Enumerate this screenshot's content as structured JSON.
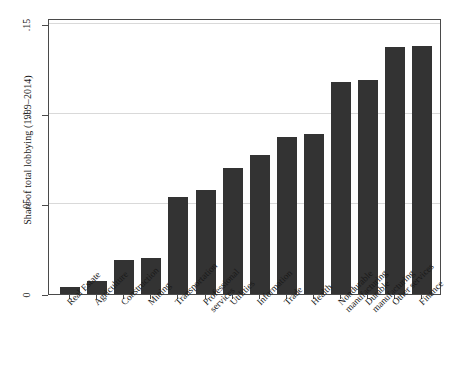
{
  "chart_data": {
    "type": "bar",
    "title": "",
    "xlabel": "",
    "ylabel": "Share of total lobbying (1999–2014)",
    "ylim": [
      0,
      0.15
    ],
    "yticks": [
      0,
      0.05,
      0.1,
      0.15
    ],
    "ytick_labels": [
      "0",
      ".05",
      ".1",
      ".15"
    ],
    "grid": true,
    "legend": "none",
    "bar_color": "#333333",
    "categories": [
      "Real Estate",
      "Agriculture",
      "Construction",
      "Mining",
      "Transportation",
      "Professional services",
      "Utilities",
      "Information",
      "Trade",
      "Health",
      "Nondurable manufacturing",
      "Durable manufacturing",
      "Other services",
      "Finance"
    ],
    "category_lines": [
      [
        "Real Estate"
      ],
      [
        "Agriculture"
      ],
      [
        "Construction"
      ],
      [
        "Mining"
      ],
      [
        "Transportation"
      ],
      [
        "Professional",
        "services"
      ],
      [
        "Utilities"
      ],
      [
        "Information"
      ],
      [
        "Trade"
      ],
      [
        "Health"
      ],
      [
        "Nondurable",
        "manufacturing"
      ],
      [
        "Durable",
        "manufacturing"
      ],
      [
        "Other services"
      ],
      [
        "Finance"
      ]
    ],
    "values": [
      0.004,
      0.007,
      0.019,
      0.02,
      0.054,
      0.058,
      0.07,
      0.077,
      0.087,
      0.089,
      0.118,
      0.119,
      0.137,
      0.138
    ]
  }
}
